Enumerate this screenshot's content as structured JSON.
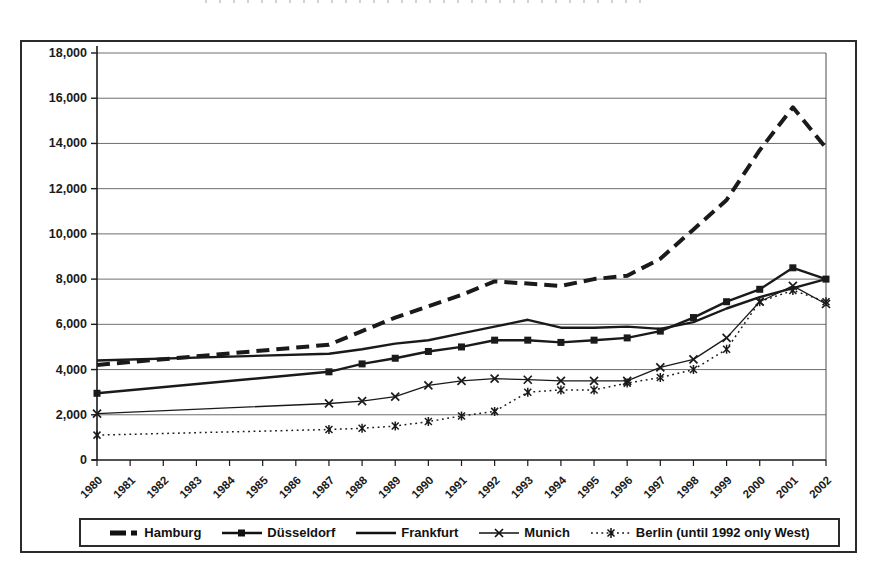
{
  "colors": {
    "ink": "#1a1a1a",
    "grid": "#4a4a4a",
    "background": "#ffffff",
    "border": "#2b2b2b"
  },
  "chart_data": {
    "type": "line",
    "xlabel": "",
    "ylabel": "",
    "xlim": [
      1980,
      2002
    ],
    "ylim": [
      0,
      18000
    ],
    "y_tick_step": 2000,
    "grid": "horizontal",
    "legend_position": "bottom",
    "y_tick_labels": [
      "0",
      "2,000",
      "4,000",
      "6,000",
      "8,000",
      "10,000",
      "12,000",
      "14,000",
      "16,000",
      "18,000"
    ],
    "x_tick_labels": [
      "1980",
      "1981",
      "1982",
      "1983",
      "1984",
      "1985",
      "1986",
      "1987",
      "1988",
      "1989",
      "1990",
      "1991",
      "1992",
      "1993",
      "1994",
      "1995",
      "1996",
      "1997",
      "1998",
      "1999",
      "2000",
      "2001",
      "2002"
    ],
    "series": [
      {
        "name": "Hamburg",
        "line": "thick-dashed",
        "marker": "none",
        "points": [
          [
            1980,
            4200
          ],
          [
            1987,
            5100
          ],
          [
            1988,
            5700
          ],
          [
            1989,
            6300
          ],
          [
            1990,
            6800
          ],
          [
            1991,
            7300
          ],
          [
            1992,
            7900
          ],
          [
            1993,
            7800
          ],
          [
            1994,
            7700
          ],
          [
            1995,
            8000
          ],
          [
            1996,
            8150
          ],
          [
            1997,
            8900
          ],
          [
            1998,
            10200
          ],
          [
            1999,
            11500
          ],
          [
            2000,
            13700
          ],
          [
            2001,
            15600
          ],
          [
            2002,
            13800
          ]
        ]
      },
      {
        "name": "Düsseldorf",
        "line": "solid-medium",
        "marker": "square",
        "points": [
          [
            1980,
            2950
          ],
          [
            1987,
            3900
          ],
          [
            1988,
            4250
          ],
          [
            1989,
            4500
          ],
          [
            1990,
            4800
          ],
          [
            1991,
            5000
          ],
          [
            1992,
            5300
          ],
          [
            1993,
            5300
          ],
          [
            1994,
            5200
          ],
          [
            1995,
            5300
          ],
          [
            1996,
            5400
          ],
          [
            1997,
            5700
          ],
          [
            1998,
            6300
          ],
          [
            1999,
            7000
          ],
          [
            2000,
            7550
          ],
          [
            2001,
            8500
          ],
          [
            2002,
            8000
          ]
        ]
      },
      {
        "name": "Frankfurt",
        "line": "solid-medium",
        "marker": "none",
        "points": [
          [
            1980,
            4400
          ],
          [
            1987,
            4700
          ],
          [
            1988,
            4900
          ],
          [
            1989,
            5150
          ],
          [
            1990,
            5300
          ],
          [
            1991,
            5600
          ],
          [
            1992,
            5900
          ],
          [
            1993,
            6200
          ],
          [
            1994,
            5850
          ],
          [
            1995,
            5850
          ],
          [
            1996,
            5900
          ],
          [
            1997,
            5800
          ],
          [
            1998,
            6100
          ],
          [
            1999,
            6700
          ],
          [
            2000,
            7200
          ],
          [
            2001,
            7600
          ],
          [
            2002,
            8000
          ]
        ]
      },
      {
        "name": "Munich",
        "line": "solid-thin",
        "marker": "x",
        "points": [
          [
            1980,
            2050
          ],
          [
            1987,
            2500
          ],
          [
            1988,
            2600
          ],
          [
            1989,
            2800
          ],
          [
            1990,
            3300
          ],
          [
            1991,
            3500
          ],
          [
            1992,
            3600
          ],
          [
            1993,
            3550
          ],
          [
            1994,
            3500
          ],
          [
            1995,
            3500
          ],
          [
            1996,
            3500
          ],
          [
            1997,
            4100
          ],
          [
            1998,
            4450
          ],
          [
            1999,
            5400
          ],
          [
            2000,
            7000
          ],
          [
            2001,
            7700
          ],
          [
            2002,
            6900
          ]
        ]
      },
      {
        "name": "Berlin (until 1992 only West)",
        "line": "dotted",
        "marker": "star",
        "points": [
          [
            1980,
            1100
          ],
          [
            1987,
            1350
          ],
          [
            1988,
            1400
          ],
          [
            1989,
            1500
          ],
          [
            1990,
            1700
          ],
          [
            1991,
            1950
          ],
          [
            1992,
            2150
          ],
          [
            1993,
            3000
          ],
          [
            1994,
            3100
          ],
          [
            1995,
            3100
          ],
          [
            1996,
            3400
          ],
          [
            1997,
            3650
          ],
          [
            1998,
            4000
          ],
          [
            1999,
            4900
          ],
          [
            2000,
            7000
          ],
          [
            2001,
            7500
          ],
          [
            2002,
            7000
          ]
        ]
      }
    ]
  }
}
